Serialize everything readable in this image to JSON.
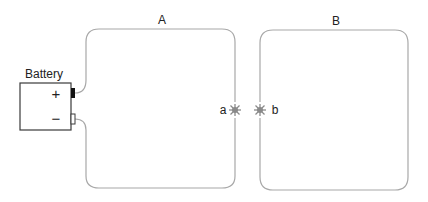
{
  "diagram": {
    "battery_label": "Battery",
    "plus_sign": "+",
    "minus_sign": "−",
    "loop_a_label": "A",
    "loop_b_label": "B",
    "point_a_label": "a",
    "point_b_label": "b",
    "wire_color": "#a8a8a8",
    "battery_color": "#3a3a3a",
    "spark_color": "#8a8a8a"
  }
}
